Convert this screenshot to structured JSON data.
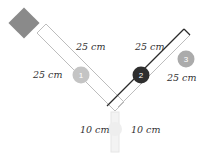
{
  "diagram": {
    "colors": {
      "source_block": "#8a8a8a",
      "track_outline": "#bdbdbd",
      "track_outline_dark": "#2b2b2b",
      "ball_1": "#c4c4c4",
      "ball_2": "#2e2e2e",
      "ball_3": "#ababab",
      "stem": "#e8e8e8"
    },
    "balls": [
      {
        "label": "1"
      },
      {
        "label": "2"
      },
      {
        "label": "3"
      }
    ],
    "labels": {
      "left_upper": "25 cm",
      "left_lower": "25 cm",
      "right_upper": "25 cm",
      "right_lower": "25 cm",
      "stem_left": "10 cm",
      "stem_right": "10 cm"
    }
  }
}
